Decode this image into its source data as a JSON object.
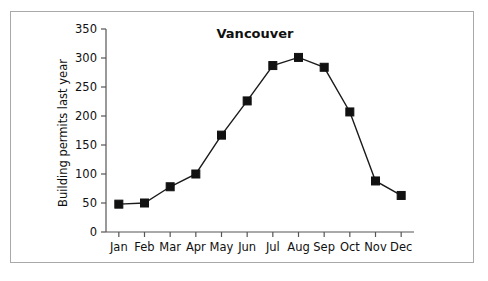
{
  "figure": {
    "background_color": "#ffffff",
    "border_color": "#a9a9a9",
    "line_color": "#1a1a1a",
    "marker_color": "#111111",
    "axis_color": "#555555",
    "text_color": "#101010"
  },
  "chart_data": {
    "type": "line",
    "title": "Vancouver",
    "subtitle": "",
    "xlabel": "",
    "ylabel": "Building permits last year",
    "categories": [
      "Jan",
      "Feb",
      "Mar",
      "Apr",
      "May",
      "Jun",
      "Jul",
      "Aug",
      "Sep",
      "Oct",
      "Nov",
      "Dec"
    ],
    "values": [
      48,
      50,
      78,
      100,
      167,
      226,
      287,
      301,
      284,
      207,
      88,
      63
    ],
    "series": [
      {
        "name": "Building permits last year",
        "values": [
          48,
          50,
          78,
          100,
          167,
          226,
          287,
          301,
          284,
          207,
          88,
          63
        ],
        "marker": "filled-square",
        "color": "#111111"
      }
    ],
    "ylim": [
      0,
      350
    ],
    "yticks": [
      0,
      50,
      100,
      150,
      200,
      250,
      300,
      350
    ],
    "ytick_labels": [
      "0",
      "50",
      "100",
      "150",
      "200",
      "250",
      "300",
      "350"
    ],
    "xtick_labels": [
      "Jan",
      "Feb",
      "Mar",
      "Apr",
      "May",
      "Jun",
      "Jul",
      "Aug",
      "Sep",
      "Oct",
      "Nov",
      "Dec"
    ],
    "grid": false,
    "legend": false,
    "legend_position": "none"
  }
}
